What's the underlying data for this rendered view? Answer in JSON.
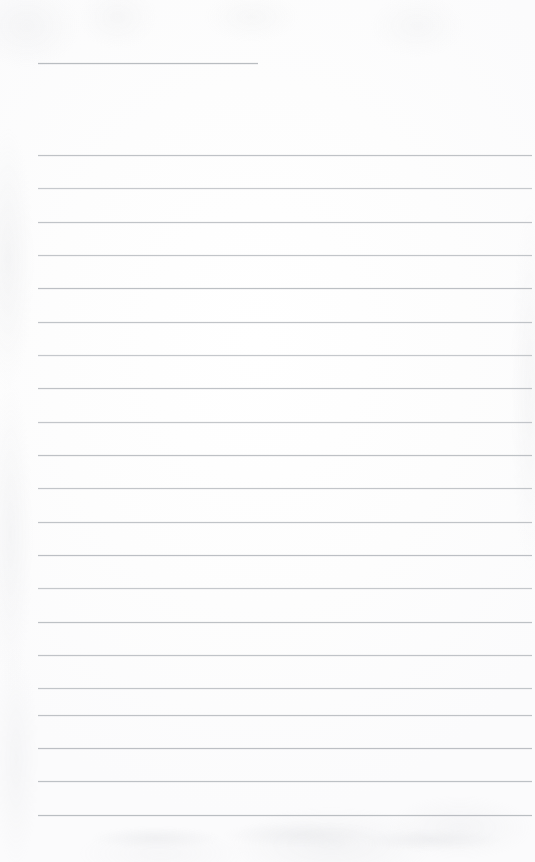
{
  "document": {
    "kind": "scanned-blank-ruled-page",
    "page_width": 535,
    "page_height": 862,
    "background_color": "#fdfdfd",
    "has_text": false,
    "has_handwriting": false,
    "visible_text": "",
    "description": "Blank scanned sheet of ruled notebook paper with no writing"
  },
  "ruling": {
    "line_color": "#b2b6bb",
    "line_thickness_px": 1,
    "left_margin_x": 38,
    "right_end_x": 532,
    "line_spacing_px": 33.3,
    "total_lines": 21,
    "header_rule": {
      "label": "short header rule",
      "x": 38,
      "y": 63,
      "width": 220,
      "color": "#b9bdc1"
    },
    "body_rules": [
      {
        "y": 155,
        "x": 38,
        "width": 494,
        "opacity": 0.82
      },
      {
        "y": 188,
        "x": 38,
        "width": 494,
        "opacity": 0.72
      },
      {
        "y": 222,
        "x": 38,
        "width": 494,
        "opacity": 0.8
      },
      {
        "y": 255,
        "x": 38,
        "width": 494,
        "opacity": 0.78
      },
      {
        "y": 288,
        "x": 38,
        "width": 494,
        "opacity": 0.86
      },
      {
        "y": 322,
        "x": 38,
        "width": 494,
        "opacity": 0.8
      },
      {
        "y": 355,
        "x": 38,
        "width": 494,
        "opacity": 0.74
      },
      {
        "y": 388,
        "x": 38,
        "width": 494,
        "opacity": 0.82
      },
      {
        "y": 422,
        "x": 38,
        "width": 494,
        "opacity": 0.76
      },
      {
        "y": 455,
        "x": 38,
        "width": 494,
        "opacity": 0.84
      },
      {
        "y": 488,
        "x": 38,
        "width": 494,
        "opacity": 0.78
      },
      {
        "y": 522,
        "x": 38,
        "width": 494,
        "opacity": 0.8
      },
      {
        "y": 555,
        "x": 38,
        "width": 494,
        "opacity": 0.86
      },
      {
        "y": 588,
        "x": 38,
        "width": 494,
        "opacity": 0.74
      },
      {
        "y": 622,
        "x": 38,
        "width": 494,
        "opacity": 0.84
      },
      {
        "y": 655,
        "x": 38,
        "width": 494,
        "opacity": 0.8
      },
      {
        "y": 688,
        "x": 38,
        "width": 494,
        "opacity": 0.78
      },
      {
        "y": 715,
        "x": 38,
        "width": 494,
        "opacity": 0.82
      },
      {
        "y": 748,
        "x": 38,
        "width": 494,
        "opacity": 0.86
      },
      {
        "y": 781,
        "x": 38,
        "width": 494,
        "opacity": 0.84
      },
      {
        "y": 815,
        "x": 38,
        "width": 494,
        "opacity": 0.88
      }
    ]
  }
}
